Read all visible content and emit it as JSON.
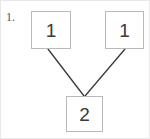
{
  "exercise": {
    "number_label": "1."
  },
  "diagram": {
    "type": "tree",
    "background_color": "#ffffff",
    "box_border_color": "#b9b9b9",
    "edge_color": "#3a3a3a",
    "text_color": "#3a3a3a",
    "nodes": [
      {
        "id": "left",
        "label": "1",
        "x": 30,
        "y": 10,
        "width": 40,
        "height": 38
      },
      {
        "id": "right",
        "label": "1",
        "x": 104,
        "y": 10,
        "width": 39,
        "height": 38
      },
      {
        "id": "sum",
        "label": "2",
        "x": 65,
        "y": 95,
        "width": 37,
        "height": 36
      }
    ],
    "edges": [
      {
        "from": "left",
        "to": "sum",
        "x1": 47,
        "y1": 48,
        "x2": 83,
        "y2": 95
      },
      {
        "from": "right",
        "to": "sum",
        "x1": 124,
        "y1": 48,
        "x2": 84,
        "y2": 95
      }
    ]
  }
}
